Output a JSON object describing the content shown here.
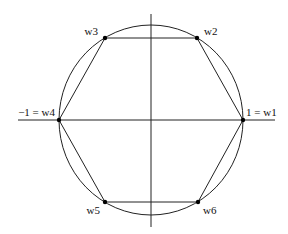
{
  "diagram": {
    "colors": {
      "stroke": "#222222",
      "point": "#000000",
      "background": "#ffffff"
    },
    "axes": {
      "horizontal": {
        "x1": 18,
        "y1": 120,
        "x2": 275,
        "y2": 120
      },
      "vertical": {
        "x1": 151,
        "y1": 14,
        "x2": 151,
        "y2": 227
      }
    },
    "circle": {
      "cx": 151,
      "cy": 120,
      "rx": 92,
      "ry": 95
    },
    "points": [
      {
        "id": "w1",
        "label": "1 = w1",
        "x": 243,
        "y": 120,
        "label_x": 246,
        "label_y": 116,
        "anchor": "start"
      },
      {
        "id": "w2",
        "label": "w2",
        "x": 197,
        "y": 38,
        "label_x": 204,
        "label_y": 35,
        "anchor": "start"
      },
      {
        "id": "w3",
        "label": "w3",
        "x": 105,
        "y": 38,
        "label_x": 98,
        "label_y": 35,
        "anchor": "end"
      },
      {
        "id": "w4",
        "label": "−1 = w4",
        "x": 59,
        "y": 120,
        "label_x": 55,
        "label_y": 116,
        "anchor": "end"
      },
      {
        "id": "w5",
        "label": "w5",
        "x": 105,
        "y": 202,
        "label_x": 100,
        "label_y": 214,
        "anchor": "end"
      },
      {
        "id": "w6",
        "label": "w6",
        "x": 198,
        "y": 202,
        "label_x": 203,
        "label_y": 214,
        "anchor": "start"
      }
    ]
  }
}
